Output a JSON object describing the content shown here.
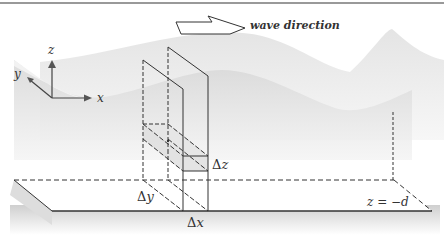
{
  "figure": {
    "wave_direction_label": "wave direction",
    "axes": {
      "z_label": "z",
      "y_label": "y",
      "x_label": "x"
    },
    "deltas": {
      "dz_symbol": "Δ",
      "dz_var": "z",
      "dy_symbol": "Δ",
      "dy_var": "y",
      "dx_symbol": "Δ",
      "dx_var": "x"
    },
    "bottom_label": "z = −d",
    "colors": {
      "line": "#333333",
      "water_shade": "#d9d9d9",
      "water_light": "#ededed",
      "slab_fill": "#e3e3e3",
      "top_rule": "#777777"
    }
  }
}
